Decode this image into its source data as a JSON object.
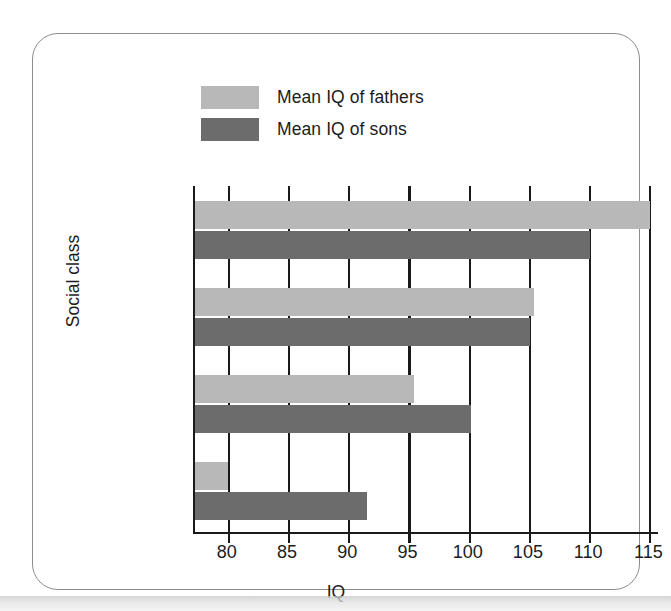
{
  "figure": {
    "legend": [
      {
        "label": "Mean IQ of fathers",
        "color": "#b8b8b8",
        "series_key": "fathers"
      },
      {
        "label": "Mean IQ of sons",
        "color": "#6c6c6c",
        "series_key": "sons"
      }
    ]
  },
  "chart_data": {
    "type": "bar",
    "orientation": "horizontal",
    "title": "",
    "xlabel": "IQ",
    "ylabel": "Social class",
    "xlim": [
      77.2,
      115.8
    ],
    "xticks": [
      80,
      85,
      90,
      95,
      100,
      105,
      110,
      115
    ],
    "xtick_labels": [
      "80",
      "85",
      "90",
      "95",
      "100",
      "105",
      "110",
      "115"
    ],
    "grid": "vertical",
    "legend_position": "top-left-outside",
    "categories": [
      "1",
      "2",
      "3",
      "4"
    ],
    "category_axis_labels": [
      "(Highest)",
      "1",
      "2",
      "3",
      "4",
      "(Lowest)"
    ],
    "series": [
      {
        "name": "Mean IQ of fathers",
        "color": "#b8b8b8",
        "values": [
          115.0,
          105.3,
          95.4,
          79.9
        ]
      },
      {
        "name": "Mean IQ of sons",
        "color": "#6c6c6c",
        "values": [
          110.0,
          105.0,
          100.1,
          91.5
        ]
      }
    ]
  }
}
